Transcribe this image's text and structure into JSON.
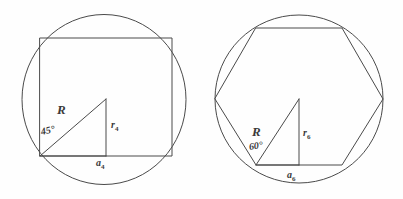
{
  "page": {
    "background_color": "#fefefe",
    "stroke_color": "#4a4a4a",
    "text_color": "#3a3a3a"
  },
  "figures": [
    {
      "id": "square-in-circle",
      "name": "Inscribed square",
      "polygon_sides": 4,
      "circle": {
        "cx": 104,
        "cy": 99,
        "r": 82
      },
      "polygon": {
        "left": 40,
        "top": 38,
        "right": 172,
        "bottom": 156
      },
      "triangle": {
        "vertex_center": {
          "x": 106,
          "y": 99
        },
        "vertex_corner": {
          "x": 40,
          "y": 156
        },
        "vertex_foot": {
          "x": 106,
          "y": 156
        }
      },
      "labels": {
        "radius": "R",
        "angle": "45°",
        "apothem": "r",
        "apothem_sub": "4",
        "side": "a",
        "side_sub": "4"
      }
    },
    {
      "id": "hexagon-in-circle",
      "name": "Inscribed hexagon",
      "polygon_sides": 6,
      "circle": {
        "cx": 299,
        "cy": 99,
        "r": 84
      },
      "polygon_vertices": "256,28 342,28 383,99 342,165 256,165 215,99",
      "triangle": {
        "vertex_center": {
          "x": 299,
          "y": 99
        },
        "vertex_corner": {
          "x": 256,
          "y": 165
        },
        "vertex_foot": {
          "x": 299,
          "y": 165
        }
      },
      "labels": {
        "radius": "R",
        "angle": "60°",
        "apothem": "r",
        "apothem_sub": "6",
        "side": "a",
        "side_sub": "6"
      }
    }
  ]
}
